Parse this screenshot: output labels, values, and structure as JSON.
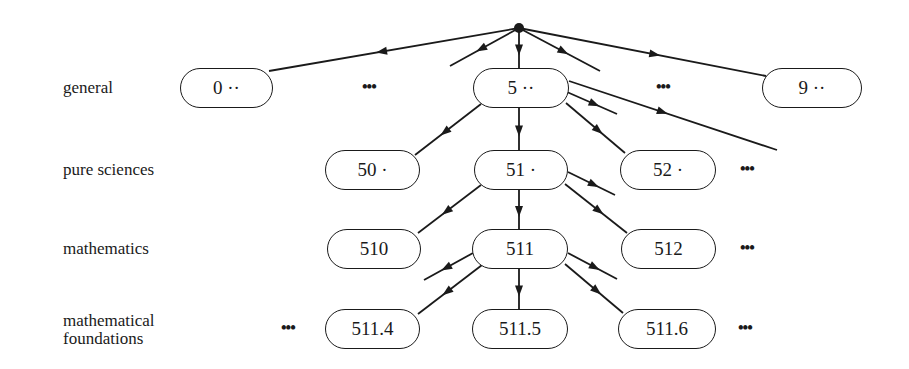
{
  "diagram": {
    "title": "",
    "levels": [
      {
        "label": "general",
        "y": 88
      },
      {
        "label": "pure sciences",
        "y": 170
      },
      {
        "label": "mathematics",
        "y": 249
      },
      {
        "label": "mathematical\nfoundations",
        "y": 329
      }
    ],
    "root": {
      "x": 519,
      "y": 28
    },
    "nodes": [
      {
        "id": "n0",
        "label": "0 ··",
        "x1": 180,
        "x2": 273,
        "y": 88
      },
      {
        "id": "n5",
        "label": "5 ··",
        "x1": 473,
        "x2": 569,
        "y": 88
      },
      {
        "id": "n9",
        "label": "9 ··",
        "x1": 762,
        "x2": 862,
        "y": 88
      },
      {
        "id": "n50",
        "label": "50 ·",
        "x1": 325,
        "x2": 420,
        "y": 170
      },
      {
        "id": "n51",
        "label": "51 ·",
        "x1": 474,
        "x2": 568,
        "y": 170
      },
      {
        "id": "n52",
        "label": "52 ·",
        "x1": 620,
        "x2": 716,
        "y": 170
      },
      {
        "id": "n510",
        "label": "510",
        "x1": 327,
        "x2": 421,
        "y": 249
      },
      {
        "id": "n511",
        "label": "511",
        "x1": 472,
        "x2": 568,
        "y": 249
      },
      {
        "id": "n512",
        "label": "512",
        "x1": 621,
        "x2": 716,
        "y": 249
      },
      {
        "id": "n5114",
        "label": "511.4",
        "x1": 325,
        "x2": 420,
        "y": 329
      },
      {
        "id": "n5115",
        "label": "511.5",
        "x1": 472,
        "x2": 568,
        "y": 329
      },
      {
        "id": "n5116",
        "label": "511.6",
        "x1": 618,
        "x2": 716,
        "y": 329
      }
    ],
    "ellipses": [
      {
        "text": "•••",
        "x": 362,
        "y": 88
      },
      {
        "text": "•••",
        "x": 656,
        "y": 88
      },
      {
        "text": "•••",
        "x": 740,
        "y": 170
      },
      {
        "text": "•••",
        "x": 740,
        "y": 249
      },
      {
        "text": "•••",
        "x": 281,
        "y": 329
      },
      {
        "text": "•••",
        "x": 738,
        "y": 329
      }
    ],
    "edges": [
      {
        "x1": 519,
        "y1": 28,
        "x2": 269,
        "y2": 71,
        "arrow": 0.55
      },
      {
        "x1": 519,
        "y1": 28,
        "x2": 450,
        "y2": 66,
        "arrow": 0.55
      },
      {
        "x1": 519,
        "y1": 28,
        "x2": 519,
        "y2": 68,
        "arrow": 0.55
      },
      {
        "x1": 519,
        "y1": 28,
        "x2": 600,
        "y2": 71,
        "arrow": 0.55
      },
      {
        "x1": 519,
        "y1": 28,
        "x2": 766,
        "y2": 76,
        "arrow": 0.55
      },
      {
        "x1": 481,
        "y1": 104,
        "x2": 415,
        "y2": 155,
        "arrow": 0.55
      },
      {
        "x1": 519,
        "y1": 108,
        "x2": 519,
        "y2": 150,
        "arrow": 0.55
      },
      {
        "x1": 567,
        "y1": 92,
        "x2": 617,
        "y2": 114,
        "arrow": 0.55
      },
      {
        "x1": 566,
        "y1": 103,
        "x2": 625,
        "y2": 153,
        "arrow": 0.55
      },
      {
        "x1": 569,
        "y1": 81,
        "x2": 777,
        "y2": 150,
        "arrow": 0.45
      },
      {
        "x1": 481,
        "y1": 185,
        "x2": 418,
        "y2": 233,
        "arrow": 0.55
      },
      {
        "x1": 519,
        "y1": 190,
        "x2": 519,
        "y2": 229,
        "arrow": 0.55
      },
      {
        "x1": 568,
        "y1": 172,
        "x2": 615,
        "y2": 195,
        "arrow": 0.55
      },
      {
        "x1": 565,
        "y1": 184,
        "x2": 627,
        "y2": 233,
        "arrow": 0.55
      },
      {
        "x1": 473,
        "y1": 253,
        "x2": 424,
        "y2": 280,
        "arrow": 0.55
      },
      {
        "x1": 482,
        "y1": 265,
        "x2": 418,
        "y2": 314,
        "arrow": 0.55
      },
      {
        "x1": 519,
        "y1": 269,
        "x2": 519,
        "y2": 309,
        "arrow": 0.55
      },
      {
        "x1": 568,
        "y1": 253,
        "x2": 617,
        "y2": 279,
        "arrow": 0.55
      },
      {
        "x1": 565,
        "y1": 264,
        "x2": 623,
        "y2": 313,
        "arrow": 0.55
      }
    ]
  }
}
